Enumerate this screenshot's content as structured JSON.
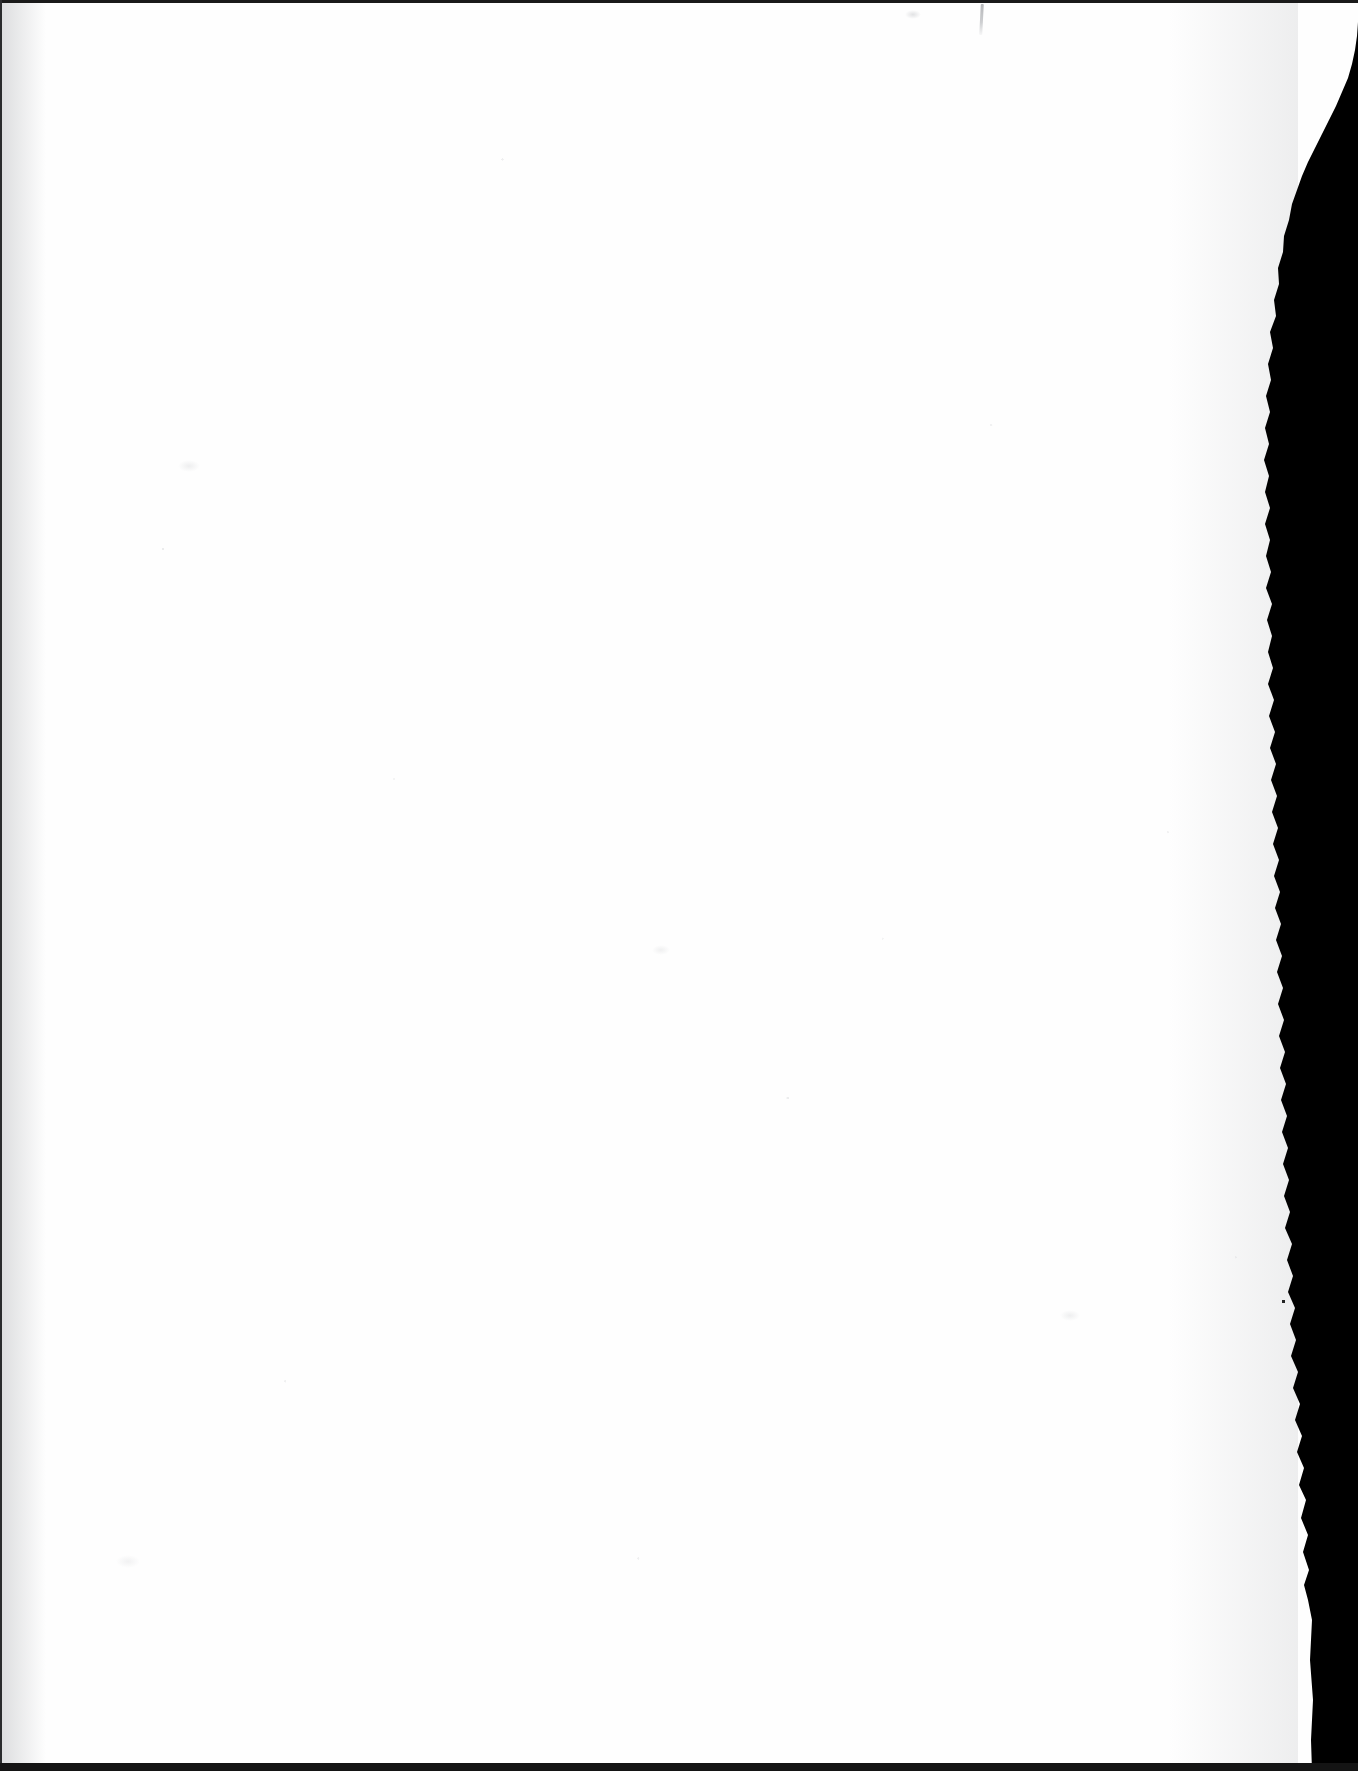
{
  "page": {
    "kind": "scanned-blank-leaf",
    "width_px": 1358,
    "height_px": 1771,
    "visible_text": ""
  },
  "colors": {
    "paper": "#fefefe",
    "paper_tint": "#f4f5f6",
    "scanner_background": "#000000",
    "edge_line_top": "#1a1a1a",
    "edge_line_left": "#2a2b2d",
    "edge_line_bottom": "#141414",
    "pencil_mark": "#7b7e83"
  },
  "artifacts": {
    "top_edge_label": "top-scan-line",
    "left_edge_label": "left-scan-line",
    "bottom_edge_label": "bottom-scan-line",
    "torn_edge_label": "torn-right-edge",
    "pencil_label": "faint-pencil-stroke",
    "cut_text_label": "clipped-text-tops",
    "cut_text_sample": "The public debt and the revenue"
  },
  "regions": {
    "paper_area_label": "paper-surface",
    "gutter_label": "gutter-shadow",
    "right_shade_label": "right-edge-shadow"
  }
}
